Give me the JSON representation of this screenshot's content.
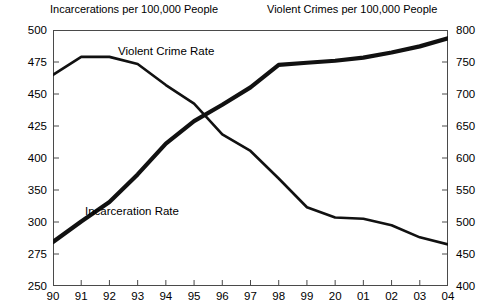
{
  "titles": {
    "left_axis": "Incarcerations per 100,000 People",
    "right_axis": "Violent Crimes per 100,000 People"
  },
  "series_labels": {
    "violent": "Violent Crime Rate",
    "incarceration": "Incarceration Rate"
  },
  "axes": {
    "left_ticks": [
      "500",
      "475",
      "450",
      "425",
      "400",
      "350",
      "300",
      "275",
      "250"
    ],
    "right_ticks": [
      "800",
      "750",
      "700",
      "650",
      "600",
      "550",
      "500",
      "450",
      "400"
    ],
    "x_ticks": [
      "90",
      "91",
      "92",
      "93",
      "94",
      "95",
      "96",
      "97",
      "98",
      "99",
      "20",
      "01",
      "02",
      "03",
      "04"
    ]
  },
  "colors": {
    "line": "#111111",
    "frame": "#4a4a4a",
    "background": "#ffffff"
  },
  "chart_data": {
    "type": "line",
    "title": "",
    "xlabel": "",
    "ylabel": "Incarcerations per 100,000 People",
    "y2label": "Violent Crimes per 100,000 People",
    "grid": false,
    "legend": "inline-annotations",
    "x": [
      "90",
      "91",
      "92",
      "93",
      "94",
      "95",
      "96",
      "97",
      "98",
      "99",
      "20",
      "01",
      "02",
      "03",
      "04"
    ],
    "ylim": [
      250,
      500
    ],
    "y2lim": [
      400,
      800
    ],
    "ytick_labels": [
      "250",
      "275",
      "300",
      "350",
      "400",
      "425",
      "450",
      "475",
      "500"
    ],
    "y2tick_labels": [
      "400",
      "450",
      "500",
      "550",
      "600",
      "650",
      "700",
      "750",
      "800"
    ],
    "series": [
      {
        "name": "Incarceration Rate",
        "axis": "left",
        "units": "per 100,000 people",
        "values": [
          293,
          313,
          332,
          359,
          389,
          411,
          427,
          444,
          466,
          468,
          470,
          473,
          478,
          484,
          492
        ]
      },
      {
        "name": "Violent Crime Rate",
        "axis": "right",
        "units": "per 100,000 people",
        "values": [
          730,
          758,
          758,
          747,
          714,
          685,
          637,
          611,
          568,
          523,
          507,
          505,
          495,
          476,
          465
        ]
      }
    ]
  }
}
